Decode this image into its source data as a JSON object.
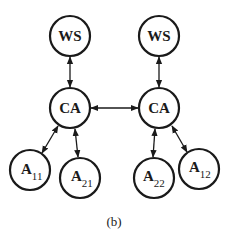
{
  "diagram": {
    "caption": "(b)",
    "nodes": {
      "ws_left": {
        "label": "WS"
      },
      "ws_right": {
        "label": "WS"
      },
      "ca_left": {
        "label": "CA"
      },
      "ca_right": {
        "label": "CA"
      },
      "a11": {
        "label": "A",
        "sub": "11"
      },
      "a21": {
        "label": "A",
        "sub": "21"
      },
      "a22": {
        "label": "A",
        "sub": "22"
      },
      "a12": {
        "label": "A",
        "sub": "12"
      }
    },
    "edges": [
      {
        "from": "ws_left",
        "to": "ca_left",
        "type": "bidirectional"
      },
      {
        "from": "ws_right",
        "to": "ca_right",
        "type": "bidirectional"
      },
      {
        "from": "ca_left",
        "to": "ca_right",
        "type": "bidirectional"
      },
      {
        "from": "ca_left",
        "to": "a11",
        "type": "bidirectional"
      },
      {
        "from": "ca_left",
        "to": "a21",
        "type": "bidirectional"
      },
      {
        "from": "ca_right",
        "to": "a22",
        "type": "bidirectional"
      },
      {
        "from": "ca_right",
        "to": "a12",
        "type": "bidirectional"
      }
    ],
    "colors": {
      "stroke": "#1a1a1a",
      "background": "#ffffff"
    }
  }
}
